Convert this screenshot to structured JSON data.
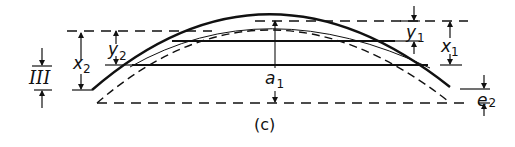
{
  "figure": {
    "caption": "(c)",
    "labels": {
      "x1": {
        "main": "x",
        "sub": "1"
      },
      "x2": {
        "main": "x",
        "sub": "2"
      },
      "y1": {
        "main": "y",
        "sub": "1"
      },
      "y2": {
        "main": "y",
        "sub": "2"
      },
      "a1": {
        "main": "a",
        "sub": "1"
      },
      "e2": {
        "main": "e",
        "sub": "2"
      },
      "region": "III"
    },
    "colors": {
      "ink": "#111111",
      "background": "#ffffff"
    }
  }
}
